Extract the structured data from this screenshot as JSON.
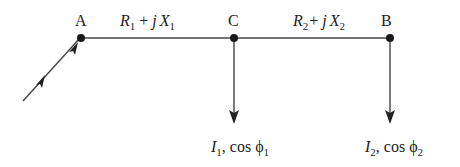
{
  "diagram": {
    "nodes": [
      {
        "id": "A",
        "label": "A",
        "x": 81,
        "y": 38
      },
      {
        "id": "C",
        "label": "C",
        "x": 234,
        "y": 38
      },
      {
        "id": "B",
        "label": "B",
        "x": 390,
        "y": 38
      }
    ],
    "segments": [
      {
        "from": "A",
        "to": "C",
        "impedance": {
          "R": "R",
          "R_sub": "1",
          "plus": "+",
          "j": "j",
          "X": "X",
          "X_sub": "1"
        }
      },
      {
        "from": "C",
        "to": "B",
        "impedance": {
          "R": "R",
          "R_sub": "2",
          "plus": "+",
          "j": "j",
          "X": "X",
          "X_sub": "2"
        }
      }
    ],
    "loads": [
      {
        "at": "C",
        "I": "I",
        "I_sub": "1",
        "sep": ",",
        "cos": "cos",
        "phi": "ϕ",
        "phi_sub": "1"
      },
      {
        "at": "B",
        "I": "I",
        "I_sub": "2",
        "sep": ",",
        "cos": "cos",
        "phi": "ϕ",
        "phi_sub": "2"
      }
    ],
    "supply": {
      "direction": "incoming to A"
    },
    "colors": {
      "line": "#444444",
      "node": "#1a1a1a",
      "text": "#222222"
    }
  }
}
